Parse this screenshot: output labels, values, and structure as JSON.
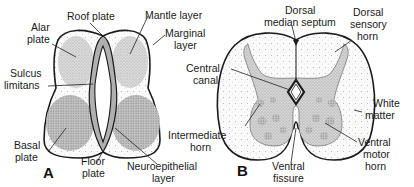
{
  "figure": {
    "panel_a": {
      "letter": "A",
      "labels": {
        "roof_plate": "Roof plate",
        "alar_plate_1": "Alar",
        "alar_plate_2": "plate",
        "mantle_layer": "Mantle layer",
        "marginal_layer_1": "Marginal",
        "marginal_layer_2": "layer",
        "sulcus_limitans_1": "Sulcus",
        "sulcus_limitans_2": "limitans",
        "basal_plate_1": "Basal",
        "basal_plate_2": "plate",
        "floor_plate_1": "Floor",
        "floor_plate_2": "plate",
        "neuroepithelial_layer_1": "Neuroepithelial",
        "neuroepithelial_layer_2": "layer"
      }
    },
    "panel_b": {
      "letter": "B",
      "labels": {
        "dorsal_median_septum_1": "Dorsal",
        "dorsal_median_septum_2": "median septum",
        "dorsal_sensory_horn_1": "Dorsal",
        "dorsal_sensory_horn_2": "sensory",
        "dorsal_sensory_horn_3": "horn",
        "central_canal_1": "Central",
        "central_canal_2": "canal",
        "white_matter_1": "White",
        "white_matter_2": "matter",
        "intermediate_horn_1": "Intermediate",
        "intermediate_horn_2": "horn",
        "ventral_fissure_1": "Ventral",
        "ventral_fissure_2": "fissure",
        "ventral_motor_horn_1": "Ventral",
        "ventral_motor_horn_2": "motor",
        "ventral_motor_horn_3": "horn"
      }
    },
    "colors": {
      "outline": "#1a1a1a",
      "gray_fill": "#d9d9d9",
      "dense_fill": "#bdbdbd",
      "background": "#ffffff"
    }
  }
}
